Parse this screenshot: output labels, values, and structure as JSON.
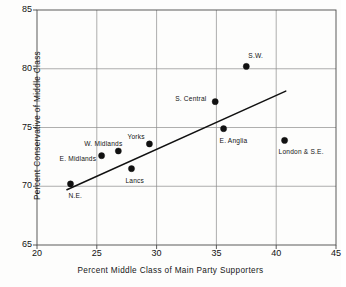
{
  "chart_data": {
    "type": "scatter",
    "title": "",
    "xlabel": "Percent Middle Class of Main Party Supporters",
    "ylabel": "Percent Conservative of Middle Class",
    "xlim": [
      20,
      45
    ],
    "ylim": [
      65,
      85
    ],
    "xticks": [
      20,
      25,
      30,
      35,
      40,
      45
    ],
    "yticks": [
      65,
      70,
      75,
      80,
      85
    ],
    "grid": true,
    "legend": "none",
    "points": [
      {
        "label": "N.E.",
        "x": 22.8,
        "y": 70.2,
        "label_dx": -2,
        "label_dy": 13
      },
      {
        "label": "E. Midlands",
        "x": 25.4,
        "y": 72.6,
        "label_dx": -42,
        "label_dy": 4
      },
      {
        "label": "W. Midlands",
        "x": 26.8,
        "y": 73.0,
        "label_dx": -34,
        "label_dy": -6
      },
      {
        "label": "Lancs",
        "x": 27.9,
        "y": 71.5,
        "label_dx": -6,
        "label_dy": 13
      },
      {
        "label": "Yorks",
        "x": 29.4,
        "y": 73.6,
        "label_dx": -22,
        "label_dy": -6
      },
      {
        "label": "S. Central",
        "x": 34.9,
        "y": 77.2,
        "label_dx": -40,
        "label_dy": -2
      },
      {
        "label": "E. Anglia",
        "x": 35.6,
        "y": 74.9,
        "label_dx": -4,
        "label_dy": 13
      },
      {
        "label": "S.W.",
        "x": 37.5,
        "y": 80.2,
        "label_dx": 2,
        "label_dy": -9
      },
      {
        "label": "London & S.E.",
        "x": 40.7,
        "y": 73.9,
        "label_dx": -6,
        "label_dy": 13
      }
    ],
    "fit_line": {
      "name": "regression-line",
      "x0": 22.5,
      "y0": 69.7,
      "x1": 40.8,
      "y1": 78.1
    },
    "colors": {
      "marker": "#111111",
      "line": "#111111",
      "grid": "#8d8d8d",
      "axis": "#4a4a4a",
      "background": "#fdfdfc"
    }
  }
}
